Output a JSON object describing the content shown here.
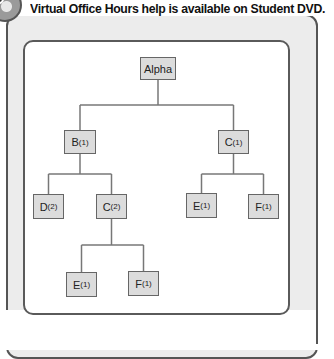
{
  "header": {
    "icon": "dvd-disc-icon",
    "text": "Virtual Office Hours help is available on Student DVD."
  },
  "tree": {
    "nodes": [
      {
        "id": "alpha",
        "label": "Alpha",
        "sub": ""
      },
      {
        "id": "b1",
        "label": "B",
        "sub": "(1)"
      },
      {
        "id": "c1",
        "label": "C",
        "sub": "(1)"
      },
      {
        "id": "d2",
        "label": "D",
        "sub": "(2)"
      },
      {
        "id": "c2",
        "label": "C",
        "sub": "(2)"
      },
      {
        "id": "e1a",
        "label": "E",
        "sub": "(1)"
      },
      {
        "id": "f1a",
        "label": "F",
        "sub": "(1)"
      },
      {
        "id": "e1b",
        "label": "E",
        "sub": "(1)"
      },
      {
        "id": "f1b",
        "label": "F",
        "sub": "(1)"
      }
    ],
    "edges": [
      [
        "alpha",
        "b1"
      ],
      [
        "alpha",
        "c1"
      ],
      [
        "b1",
        "d2"
      ],
      [
        "b1",
        "c2"
      ],
      [
        "c2",
        "e1b"
      ],
      [
        "c2",
        "f1b"
      ],
      [
        "c1",
        "e1a"
      ],
      [
        "c1",
        "f1a"
      ]
    ]
  }
}
